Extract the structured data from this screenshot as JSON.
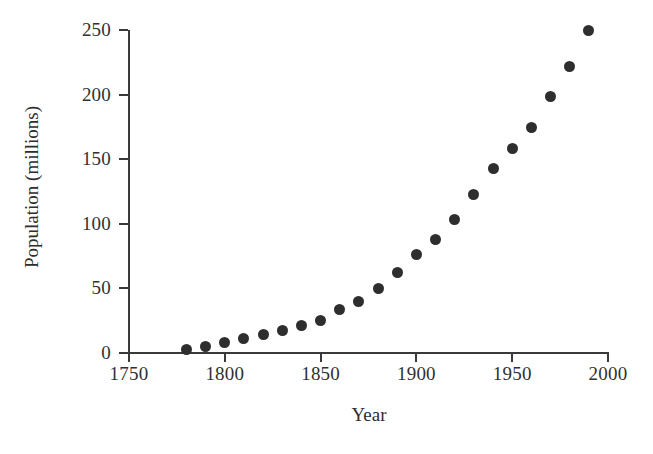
{
  "chart_data": {
    "type": "scatter",
    "title": "",
    "xlabel": "Year",
    "ylabel": "Population (millions)",
    "xlim": [
      1750,
      2000
    ],
    "ylim": [
      0,
      250
    ],
    "xticks": [
      1750,
      1800,
      1850,
      1900,
      1950,
      2000
    ],
    "xticklabels": [
      "1750",
      "1800",
      "1850",
      "1900",
      "1950",
      "2000"
    ],
    "yticks": [
      0,
      50,
      100,
      150,
      200,
      250
    ],
    "yticklabels": [
      "0",
      "50",
      "100",
      "150",
      "200",
      "250"
    ],
    "grid": false,
    "legend": null,
    "marker": "filled-circle",
    "marker_color": "#2e2e2e",
    "marker_size_px": 11,
    "x": [
      1780,
      1790,
      1800,
      1810,
      1820,
      1830,
      1840,
      1850,
      1860,
      1870,
      1880,
      1890,
      1900,
      1910,
      1920,
      1930,
      1940,
      1950,
      1960,
      1970,
      1980,
      1990
    ],
    "y": [
      2.8,
      5.3,
      7.9,
      11.2,
      14.5,
      17.8,
      21.2,
      25.4,
      33.5,
      40.2,
      49.8,
      62.3,
      76.0,
      87.8,
      103.2,
      122.5,
      142.5,
      158.0,
      174.5,
      198.5,
      222.0,
      249.5
    ],
    "points": [
      {
        "year": 1780,
        "population": 2.8
      },
      {
        "year": 1790,
        "population": 5.3
      },
      {
        "year": 1800,
        "population": 7.9
      },
      {
        "year": 1810,
        "population": 11.2
      },
      {
        "year": 1820,
        "population": 14.5
      },
      {
        "year": 1830,
        "population": 17.8
      },
      {
        "year": 1840,
        "population": 21.2
      },
      {
        "year": 1850,
        "population": 25.4
      },
      {
        "year": 1860,
        "population": 33.5
      },
      {
        "year": 1870,
        "population": 40.2
      },
      {
        "year": 1880,
        "population": 49.8
      },
      {
        "year": 1890,
        "population": 62.3
      },
      {
        "year": 1900,
        "population": 76.0
      },
      {
        "year": 1910,
        "population": 87.8
      },
      {
        "year": 1920,
        "population": 103.2
      },
      {
        "year": 1930,
        "population": 122.5
      },
      {
        "year": 1940,
        "population": 142.5
      },
      {
        "year": 1950,
        "population": 158.0
      },
      {
        "year": 1960,
        "population": 174.5
      },
      {
        "year": 1970,
        "population": 198.5
      },
      {
        "year": 1980,
        "population": 222.0
      },
      {
        "year": 1990,
        "population": 249.5
      }
    ]
  },
  "colors": {
    "background": "#ffffff",
    "axis": "#3a3a3a",
    "text": "#2e2e2e",
    "marker": "#2e2e2e"
  }
}
